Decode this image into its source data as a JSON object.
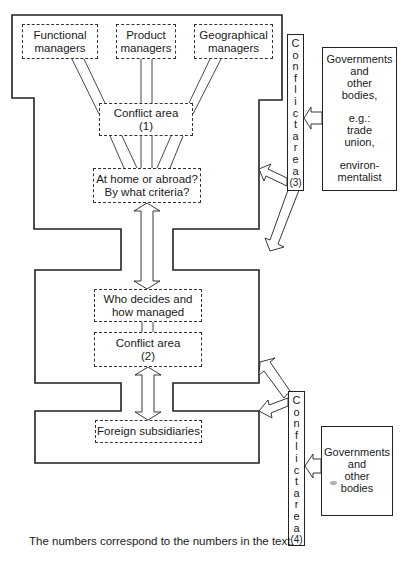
{
  "diagram": {
    "nodes": {
      "functional_managers": {
        "line1": "Functional",
        "line2": "managers"
      },
      "product_managers": {
        "line1": "Product",
        "line2": "managers"
      },
      "geographical_managers": {
        "line1": "Geographical",
        "line2": "managers"
      },
      "conflict_area_1": {
        "line1": "Conflict area",
        "line2": "(1)"
      },
      "home_or_abroad": {
        "line1": "At home or abroad?",
        "line2": "By what criteria?"
      },
      "who_decides": {
        "line1": "Who decides and",
        "line2": "how managed"
      },
      "conflict_area_2": {
        "line1": "Conflict area",
        "line2": "(2)"
      },
      "foreign_subsidiaries": {
        "line1": "Foreign subsidiaries"
      }
    },
    "conflict_bars": {
      "bar3": {
        "letters": [
          "C",
          "o",
          "n",
          "f",
          "l",
          "i",
          "c",
          "t",
          "a",
          "r",
          "e",
          "a",
          "(3)"
        ]
      },
      "bar4": {
        "letters": [
          "C",
          "o",
          "n",
          "f",
          "l",
          "i",
          "c",
          "t",
          "a",
          "r",
          "e",
          "a",
          "(4)"
        ]
      }
    },
    "external": {
      "governments_1": {
        "lines": [
          "Governments",
          "and",
          "other",
          "bodies,",
          "",
          "e.g.:",
          "trade",
          "union,",
          "",
          "environ-",
          "mentalist"
        ]
      },
      "governments_2": {
        "lines": [
          "Governments",
          "and",
          "other",
          "bodies"
        ]
      }
    },
    "caption": "The numbers correspond to the numbers in the text.",
    "colors": {
      "line": "#222222",
      "background": "#ffffff"
    }
  }
}
